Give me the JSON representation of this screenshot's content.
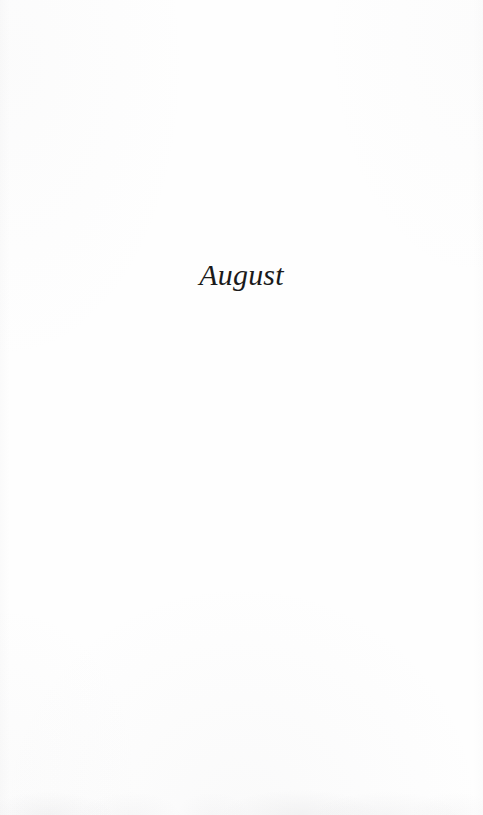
{
  "document": {
    "type": "book-section-divider-page",
    "page_background_color": "#fefefe",
    "ink_color": "#1a1a1a"
  },
  "section": {
    "title": "August"
  }
}
